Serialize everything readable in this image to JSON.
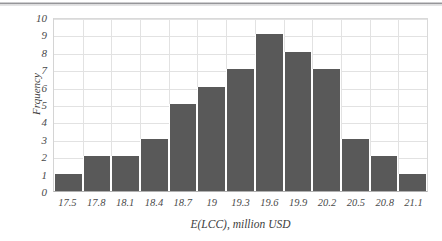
{
  "chart_data": {
    "type": "bar",
    "title": "",
    "subtitle": "",
    "xlabel": "E(LCC), million USD",
    "ylabel": "Frquency",
    "categories": [
      "17.5",
      "17.8",
      "18.1",
      "18.4",
      "18.7",
      "19",
      "19.3",
      "19.6",
      "19.9",
      "20.2",
      "20.5",
      "20.8",
      "21.1"
    ],
    "values": [
      1,
      2,
      2,
      3,
      5,
      6,
      7,
      9,
      8,
      7,
      3,
      2,
      1
    ],
    "ylim": [
      0,
      10
    ],
    "yticks": [
      "10",
      "9",
      "8",
      "7",
      "6",
      "5",
      "4",
      "3",
      "2",
      "1",
      "0"
    ],
    "grid": "both",
    "legend": "none",
    "bar_color": "#595959",
    "grid_color": "#e2e2e2",
    "axis_color": "#b0b0b0",
    "text_color": "#4a4a4a"
  }
}
